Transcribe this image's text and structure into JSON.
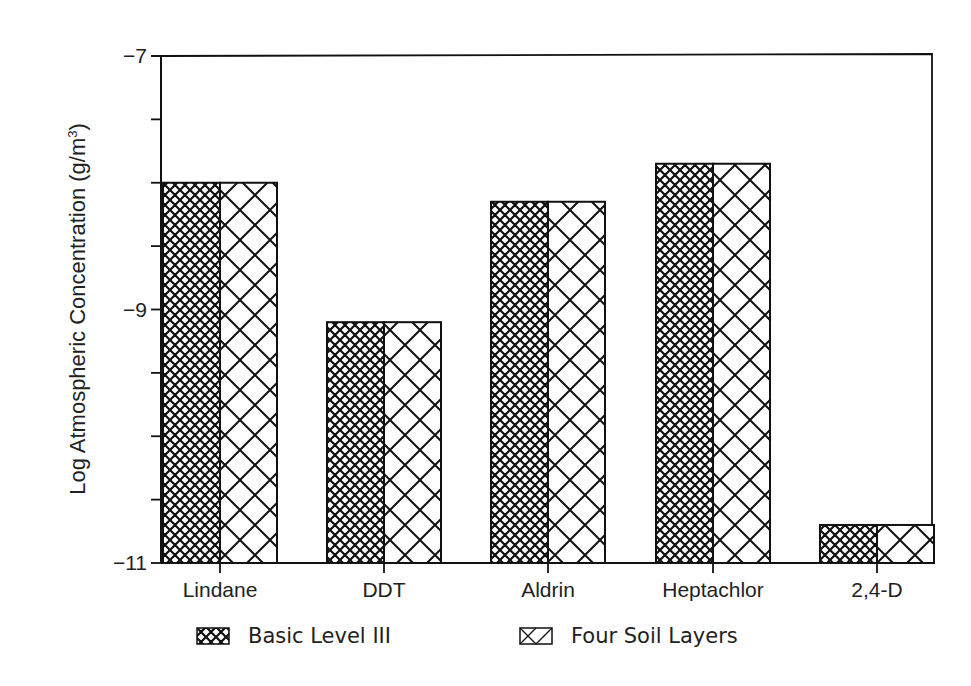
{
  "chart_data": {
    "type": "bar",
    "title": "",
    "xlabel": "",
    "ylabel": "Log Atmospheric Concentration (g/m³)",
    "ylim": [
      -11,
      -7
    ],
    "yticks_labeled": [
      "-7",
      "-9",
      "-11"
    ],
    "ytick_step": 0.5,
    "grid": false,
    "legend_position": "bottom",
    "categories": [
      "Lindane",
      "DDT",
      "Aldrin",
      "Heptachlor",
      "2,4-D"
    ],
    "series": [
      {
        "name": "Basic Level III",
        "pattern": "fine-crosshatch",
        "values": [
          -8.0,
          -9.1,
          -8.15,
          -7.85,
          -10.7
        ]
      },
      {
        "name": "Four Soil Layers",
        "pattern": "coarse-crosshatch",
        "values": [
          -8.0,
          -9.1,
          -8.15,
          -7.85,
          -10.7
        ]
      }
    ]
  },
  "axis": {
    "y_top_label": "−7",
    "y_mid_label": "−9",
    "y_bottom_label": "−11"
  },
  "legend": {
    "items": [
      {
        "label": "Basic Level III"
      },
      {
        "label": "Four Soil Layers"
      }
    ]
  },
  "ylabel_text": "Log Atmospheric Concentration (g/m",
  "ylabel_sup": "3",
  "ylabel_tail": ")"
}
